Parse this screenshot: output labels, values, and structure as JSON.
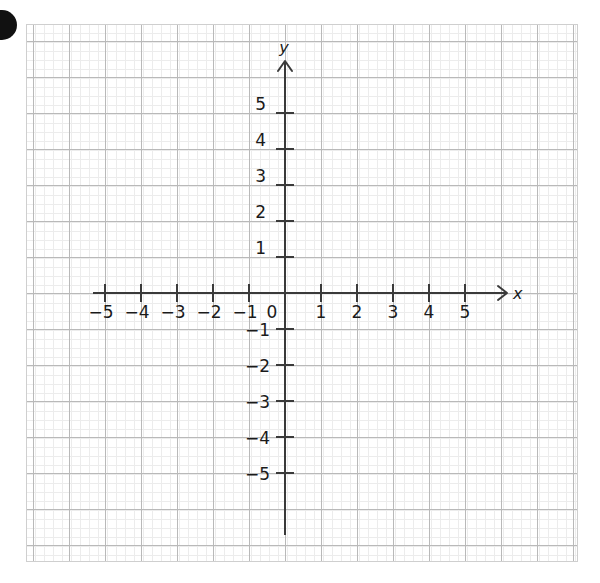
{
  "figure": {
    "background_color": "#ffffff"
  },
  "marker": {
    "name": "corner-dot",
    "shape": "filled-circle",
    "color": "#111111",
    "cx": 2,
    "cy": 25,
    "r": 15
  },
  "grid": {
    "left": 26,
    "top": 24,
    "right": 578,
    "bottom": 562,
    "major_step_px": 36,
    "minor_step_px": 9,
    "major_color": "#b9b9b9",
    "minor_color": "#ececec",
    "border_color": "#cfcfcf",
    "show_minor": true,
    "show_major": true
  },
  "axes": {
    "color": "#3a3a3a",
    "origin_px": {
      "x": 285,
      "y": 293
    },
    "unit_px": 36,
    "tick_len": 9,
    "x_axis": {
      "label": "x",
      "label_style": "italic",
      "arrow": "open-v",
      "arrow_direction": "right",
      "start_px": 93,
      "end_px": 506,
      "origin_label": "0"
    },
    "y_axis": {
      "label": "y",
      "label_style": "italic",
      "arrow": "open-v",
      "arrow_direction": "up",
      "start_px": 535,
      "end_px": 62
    }
  },
  "chart_data": {
    "type": "line",
    "title": "",
    "xlabel": "x",
    "ylabel": "y",
    "xlim": [
      -5.75,
      6.1
    ],
    "ylim": [
      -6.4,
      6.4
    ],
    "grid": true,
    "legend": "none",
    "series": [],
    "x_ticks": [
      -5,
      -4,
      -3,
      -2,
      -1,
      1,
      2,
      3,
      4,
      5
    ],
    "y_ticks": [
      -5,
      -4,
      -3,
      -2,
      -1,
      1,
      2,
      3,
      4,
      5
    ],
    "x_tick_labels": [
      "−5",
      "−4",
      "−3",
      "−2",
      "−1",
      "1",
      "2",
      "3",
      "4",
      "5"
    ],
    "y_tick_labels": [
      "−5",
      "−4",
      "−3",
      "−2",
      "−1",
      "1",
      "2",
      "3",
      "4",
      "5"
    ],
    "origin_label": "0",
    "annotations": []
  },
  "labels": {
    "x_neg_5": "−5",
    "x_neg_4": "−4",
    "x_neg_3": "−3",
    "x_neg_2": "−2",
    "x_neg_1": "−1",
    "origin": "0",
    "x_pos_1": "1",
    "x_pos_2": "2",
    "x_pos_3": "3",
    "x_pos_4": "4",
    "x_pos_5": "5",
    "y_pos_1": "1",
    "y_pos_2": "2",
    "y_pos_3": "3",
    "y_pos_4": "4",
    "y_pos_5": "5",
    "y_neg_1": "−1",
    "y_neg_2": "−2",
    "y_neg_3": "−3",
    "y_neg_4": "−4",
    "y_neg_5": "−5",
    "x_axis_name": "x",
    "y_axis_name": "y"
  }
}
